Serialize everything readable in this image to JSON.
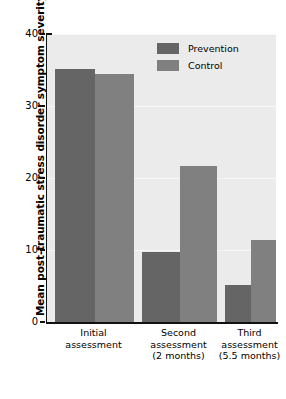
{
  "chart_data": {
    "type": "bar",
    "title": "",
    "xlabel": "",
    "ylabel": "Mean post-traumatic stress disorder symptom severity",
    "ylim": [
      0,
      40
    ],
    "yticks": [
      0,
      10,
      20,
      30,
      40
    ],
    "grid": true,
    "legend_position": "top-right",
    "categories": [
      "Initial assessment",
      "Second assessment (2 months)",
      "Third assessment (5.5 months)"
    ],
    "category_lines": [
      [
        "Initial",
        "assessment"
      ],
      [
        "Second",
        "assessment",
        "(2 months)"
      ],
      [
        "Third",
        "assessment",
        "(5.5 months)"
      ]
    ],
    "series": [
      {
        "name": "Prevention",
        "color": "#656565",
        "values": [
          35.2,
          9.7,
          5.1
        ]
      },
      {
        "name": "Control",
        "color": "#808080",
        "values": [
          34.5,
          21.7,
          11.4
        ]
      }
    ]
  },
  "legend": {
    "items": [
      {
        "label": "Prevention"
      },
      {
        "label": "Control"
      }
    ]
  },
  "axis": {
    "y_title": "Mean post-traumatic stress disorder symptom severity",
    "y_tick_labels": [
      "40",
      "30",
      "20",
      "10",
      "0"
    ]
  },
  "colors": {
    "prevention": "#656565",
    "control": "#808080",
    "plot_background": "#ebebeb",
    "axis": "#111111"
  }
}
